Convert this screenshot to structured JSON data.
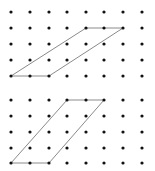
{
  "colors": {
    "dot": "#111111",
    "line": "#8a8a8a",
    "background": "#ffffff"
  },
  "grid": {
    "columns_x": [
      11,
      30,
      49,
      67,
      86,
      104,
      123,
      142
    ],
    "dot_radius": 1.6
  },
  "figures": [
    {
      "name": "top-dot-grid",
      "rows_y": [
        12,
        28,
        44,
        60,
        76
      ],
      "parallelogram": [
        [
          0,
          4
        ],
        [
          2,
          4
        ],
        [
          6,
          1
        ],
        [
          4,
          1
        ]
      ]
    },
    {
      "name": "bottom-dot-grid",
      "rows_y": [
        100,
        116,
        132,
        148,
        163
      ],
      "parallelogram": [
        [
          0,
          4
        ],
        [
          2,
          4
        ],
        [
          5,
          0
        ],
        [
          3,
          0
        ]
      ]
    }
  ]
}
